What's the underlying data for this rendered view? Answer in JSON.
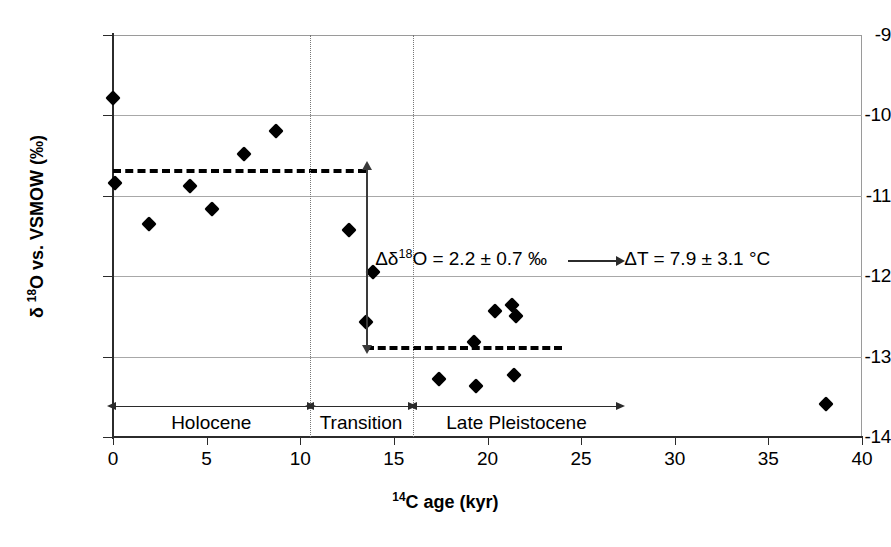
{
  "chart_data": {
    "type": "scatter",
    "title": "",
    "xlabel": "14C age (kyr)",
    "xlabel_html": "<sup>14</sup>C age (kyr)",
    "ylabel": "δ 18O vs. VSMOW (‰)",
    "ylabel_html": "&delta; <sup>18</sup>O vs. VSMOW (&permil;)",
    "xlim": [
      0,
      40
    ],
    "ylim": [
      -14,
      -9
    ],
    "xticks": [
      "0",
      "5",
      "10",
      "15",
      "20",
      "25",
      "30",
      "35",
      "40"
    ],
    "xtick_values": [
      0,
      5,
      10,
      15,
      20,
      25,
      30,
      35,
      40
    ],
    "yticks": [
      "-9",
      "-10",
      "-11",
      "-12",
      "-13",
      "-14"
    ],
    "ytick_values": [
      -9,
      -10,
      -11,
      -12,
      -13,
      -14
    ],
    "grid": true,
    "legend": "none",
    "marker": "filled-diamond",
    "marker_color": "#000000",
    "points": [
      {
        "x": 0.0,
        "y": -9.78
      },
      {
        "x": 0.1,
        "y": -10.84
      },
      {
        "x": 1.9,
        "y": -11.35
      },
      {
        "x": 4.1,
        "y": -10.88
      },
      {
        "x": 5.3,
        "y": -11.16
      },
      {
        "x": 7.0,
        "y": -10.48
      },
      {
        "x": 8.7,
        "y": -10.2
      },
      {
        "x": 12.6,
        "y": -11.42
      },
      {
        "x": 13.9,
        "y": -11.95
      },
      {
        "x": 13.5,
        "y": -12.57
      },
      {
        "x": 17.4,
        "y": -13.28
      },
      {
        "x": 19.3,
        "y": -12.82
      },
      {
        "x": 19.4,
        "y": -13.37
      },
      {
        "x": 20.4,
        "y": -12.43
      },
      {
        "x": 21.3,
        "y": -12.36
      },
      {
        "x": 21.5,
        "y": -12.5
      },
      {
        "x": 21.4,
        "y": -13.23
      },
      {
        "x": 38.1,
        "y": -13.59
      }
    ],
    "mean_lines": [
      {
        "name": "holocene-mean",
        "y": -10.67,
        "x_start": 0.0,
        "x_end": 13.5,
        "style": "dashed"
      },
      {
        "name": "late-pleistocene-mean",
        "y": -12.87,
        "x_start": 13.5,
        "x_end": 24.0,
        "style": "dashed"
      }
    ],
    "delta_arrow": {
      "x": 13.5,
      "y_top": -10.67,
      "y_bottom": -12.87,
      "style": "double-headed"
    },
    "annotations": [
      {
        "name": "delta-d18o-annotation",
        "text": "Δδ18O = 2.2 ± 0.7 ‰",
        "html": "&Delta;&delta;<sup>18</sup>O = 2.2 &plusmn; 0.7 &permil;",
        "x": 14.0,
        "y": -11.8
      },
      {
        "name": "delta-t-annotation",
        "text": "ΔT = 7.9 ± 3.1 °C",
        "html": "&Delta;T = 7.9 &plusmn; 3.1 &deg;C",
        "x": 27.3,
        "y": -11.8
      }
    ],
    "dividers": [
      {
        "name": "holocene-transition-divider",
        "x": 10.5
      },
      {
        "name": "transition-pleistocene-divider",
        "x": 16.0
      }
    ],
    "regions": [
      {
        "name": "holocene",
        "label": "Holocene",
        "x_start": 0.1,
        "x_end": 10.4
      },
      {
        "name": "transition",
        "label": "Transition",
        "x_start": 10.7,
        "x_end": 15.8
      },
      {
        "name": "late-pleistocene",
        "label": "Late Pleistocene",
        "x_start": 16.2,
        "x_end": 26.9
      }
    ],
    "region_band_y": -13.62
  }
}
